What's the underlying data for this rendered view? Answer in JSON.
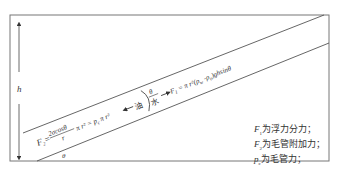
{
  "diagram": {
    "type": "inclined-capillary-force-diagram",
    "height_label": "h",
    "angle_label_bottom": "θ",
    "angle_label_interface": "θ",
    "phase_left": "油",
    "phase_right": "水",
    "formula_left": {
      "lhs": "F",
      "lhs_sub": "2",
      "eq": "=",
      "frac_num": "2σcosθ",
      "frac_den": "r",
      "rest": "π r² = p",
      "rest_sub": "c",
      "tail": " π r²"
    },
    "formula_right": {
      "lhs": "F",
      "lhs_sub": "1",
      "text": " = π r²(ρ",
      "sub_w": "w",
      "minus": " -ρ",
      "sub_o": "o",
      "tail": ")ghsinθ"
    },
    "legend": [
      {
        "symbol": "F",
        "sub": "1",
        "text": "为浮力分力；"
      },
      {
        "symbol": "F",
        "sub": "2",
        "text": "为毛管附加力；"
      },
      {
        "symbol": "p",
        "sub": "c",
        "text": "为毛管力；"
      }
    ],
    "colors": {
      "line": "#555555",
      "text": "#333333",
      "background": "#ffffff"
    }
  }
}
